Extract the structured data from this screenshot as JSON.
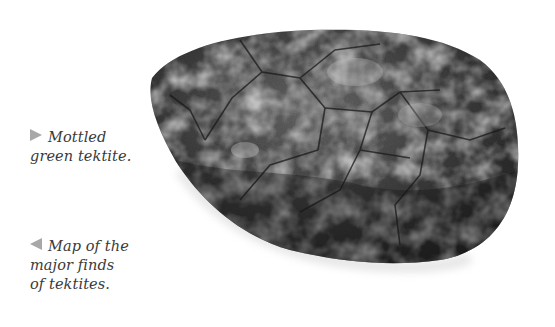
{
  "captions": [
    {
      "arrow": "right",
      "line1": "Mottled",
      "line2": "green tektite.",
      "line3": ""
    },
    {
      "arrow": "left",
      "line1": "Map of the",
      "line2": "major finds",
      "line3": "of tektites."
    }
  ],
  "image": {
    "subject": "mottled-green-tektite",
    "tone": "grayscale"
  },
  "colors": {
    "arrow": "#a8a8a8",
    "text": "#3a3a3a",
    "background": "#ffffff"
  }
}
